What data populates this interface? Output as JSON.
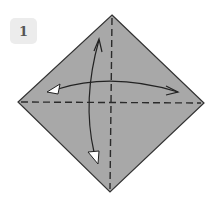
{
  "step": {
    "number": "1"
  },
  "diagram": {
    "paper_color": "#a8a8a8",
    "outline_color": "#333333",
    "fold_line_color": "#2a2a2a",
    "fold_lines": [
      "vertical-valley-fold",
      "horizontal-valley-fold"
    ],
    "arrows": [
      "fold-and-unfold-horizontal",
      "fold-and-unfold-vertical"
    ]
  }
}
